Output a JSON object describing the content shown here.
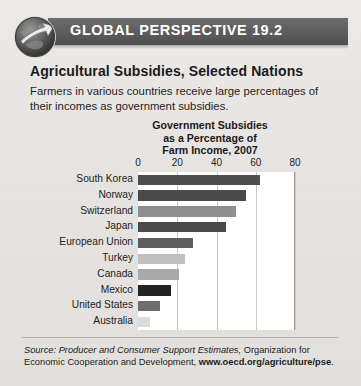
{
  "banner": {
    "icon": "globe-arrow-icon",
    "title": "GLOBAL PERSPECTIVE 19.2",
    "bg_color": "#5c5c5c",
    "text_color": "#ffffff"
  },
  "article": {
    "subtitle": "Agricultural Subsidies, Selected Nations",
    "intro": "Farmers in various countries receive large percentages of their incomes as government subsidies."
  },
  "chart_data": {
    "type": "bar",
    "orientation": "horizontal",
    "title_lines": [
      "Government Subsidies",
      "as a Percentage of",
      "Farm Income, 2007"
    ],
    "categories": [
      "South Korea",
      "Norway",
      "Switzerland",
      "Japan",
      "European Union",
      "Turkey",
      "Canada",
      "Mexico",
      "United States",
      "Australia"
    ],
    "values": [
      62,
      55,
      50,
      45,
      28,
      24,
      21,
      17,
      11,
      6
    ],
    "bar_colors": [
      "#4e4e4e",
      "#4a4a4a",
      "#8f8f8f",
      "#4b4b4b",
      "#5e5e5e",
      "#c0c0c0",
      "#a9a9a9",
      "#232323",
      "#6e6e6e",
      "#dcdcdc"
    ],
    "xlabel": "",
    "ylabel": "",
    "xlim": [
      0,
      80
    ],
    "xticks": [
      0,
      20,
      40,
      60,
      80
    ],
    "ticklabels": [
      "0",
      "20",
      "40",
      "60",
      "80"
    ],
    "grid": true,
    "grid_axis": "x",
    "legend": "none",
    "plot_background": "#ffffff"
  },
  "source": {
    "label": "Source:",
    "italic_part": "Producer and Consumer Support Estimates,",
    "text_part": " Organization for Economic Cooperation and Development, ",
    "url": "www.oecd.org/agriculture/pse",
    "period": "."
  }
}
